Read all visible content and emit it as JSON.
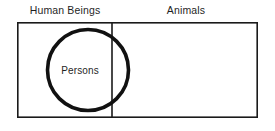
{
  "diagram": {
    "type": "euler-venn",
    "background_color": "#ffffff",
    "stroke_color": "#1a1a1a",
    "text_color": "#1f1f1f",
    "universe": {
      "label": "",
      "rect": {
        "x": 17,
        "y": 22,
        "width": 241,
        "height": 96
      },
      "border_width": 1.6
    },
    "divider": {
      "label": "",
      "x": 112,
      "y1": 22,
      "y2": 118,
      "width": 1.6
    },
    "regions": [
      {
        "id": "human-beings",
        "label": "Human Beings",
        "label_x": 65,
        "label_y": 14,
        "side": "left"
      },
      {
        "id": "animals",
        "label": "Animals",
        "label_x": 186,
        "label_y": 14,
        "side": "right"
      }
    ],
    "circles": [
      {
        "id": "persons",
        "label": "Persons",
        "cx": 88,
        "cy": 70,
        "r": 40.5,
        "stroke_width": 3.6,
        "fill": "none",
        "label_x": 80,
        "label_y": 73
      }
    ]
  }
}
